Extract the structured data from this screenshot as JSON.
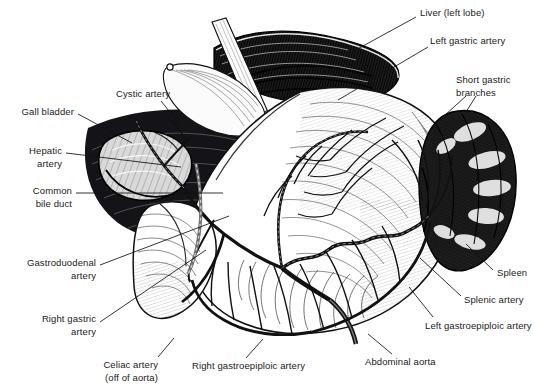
{
  "illustration": {
    "title": "Celiac artery axis and upper abdominal vascular anatomy",
    "style": "pen-and-ink medical engraving, black on white",
    "background_color": "#ffffff",
    "ink_color": "#111111",
    "width": 534,
    "height": 390
  },
  "labels": [
    {
      "id": "liver-left-lobe",
      "text": "Liver (left lobe)",
      "x": 420,
      "y": 12,
      "align": "left",
      "lines": [
        "Liver (left lobe)"
      ]
    },
    {
      "id": "left-gastric-artery",
      "text": "Left gastric artery",
      "x": 430,
      "y": 40,
      "align": "left",
      "lines": [
        "Left gastric artery"
      ]
    },
    {
      "id": "short-gastric-branches",
      "text": "Short gastric branches",
      "x": 456,
      "y": 79,
      "align": "left",
      "lines": [
        "Short gastric",
        "branches"
      ]
    },
    {
      "id": "spleen",
      "text": "Spleen",
      "x": 497,
      "y": 272,
      "align": "left",
      "lines": [
        "Spleen"
      ]
    },
    {
      "id": "splenic-artery",
      "text": "Splenic artery",
      "x": 464,
      "y": 299,
      "align": "left",
      "lines": [
        "Splenic artery"
      ]
    },
    {
      "id": "left-gastroepiploic-artery",
      "text": "Left gastroepiploic artery",
      "x": 425,
      "y": 325,
      "align": "left",
      "lines": [
        "Left gastroepiploic artery"
      ]
    },
    {
      "id": "abdominal-aorta",
      "text": "Abdominal aorta",
      "x": 365,
      "y": 361,
      "align": "left",
      "lines": [
        "Abdominal aorta"
      ]
    },
    {
      "id": "right-gastroepiploic-artery",
      "text": "Right gastroepiploic artery",
      "x": 192,
      "y": 365,
      "align": "left",
      "lines": [
        "Right gastroepiploic artery"
      ]
    },
    {
      "id": "celiac-artery",
      "text": "Celiac artery (off of aorta)",
      "x": 150,
      "y": 364,
      "align": "right",
      "lines": [
        "Celiac artery",
        "(off of aorta)"
      ]
    },
    {
      "id": "right-gastric-artery",
      "text": "Right gastric artery",
      "x": 92,
      "y": 318,
      "align": "right",
      "lines": [
        "Right gastric",
        "artery"
      ]
    },
    {
      "id": "gastroduodenal-artery",
      "text": "Gastroduodenal artery",
      "x": 92,
      "y": 262,
      "align": "right",
      "lines": [
        "Gastroduodenal",
        "artery"
      ]
    },
    {
      "id": "common-bile-duct",
      "text": "Common bile duct",
      "x": 68,
      "y": 190,
      "align": "right",
      "lines": [
        "Common",
        "bile duct"
      ]
    },
    {
      "id": "hepatic-artery",
      "text": "Hepatic artery",
      "x": 58,
      "y": 150,
      "align": "right",
      "lines": [
        "Hepatic",
        "artery"
      ]
    },
    {
      "id": "gall-bladder",
      "text": "Gall bladder",
      "x": 70,
      "y": 111,
      "align": "right",
      "lines": [
        "Gall bladder"
      ]
    },
    {
      "id": "cystic-artery",
      "text": "Cystic artery",
      "x": 116,
      "y": 93,
      "align": "left",
      "lines": [
        "Cystic artery"
      ]
    }
  ],
  "leader_lines": [
    {
      "for": "liver-left-lobe",
      "x1": 416,
      "y1": 17,
      "x2": 352,
      "y2": 52
    },
    {
      "for": "left-gastric-artery",
      "x1": 428,
      "y1": 47,
      "x2": 338,
      "y2": 100
    },
    {
      "for": "short-gastric-branches",
      "x1": 466,
      "y1": 94,
      "x2": 442,
      "y2": 115
    },
    {
      "for": "short-gastric-branches-2",
      "x1": 474,
      "y1": 94,
      "x2": 462,
      "y2": 112
    },
    {
      "for": "spleen",
      "x1": 493,
      "y1": 272,
      "x2": 466,
      "y2": 245
    },
    {
      "for": "splenic-artery",
      "x1": 460,
      "y1": 296,
      "x2": 418,
      "y2": 258
    },
    {
      "for": "left-gastroepiploic-artery",
      "x1": 432,
      "y1": 316,
      "x2": 408,
      "y2": 286
    },
    {
      "for": "abdominal-aorta",
      "x1": 393,
      "y1": 354,
      "x2": 368,
      "y2": 336
    },
    {
      "for": "right-gastroepiploic-artery",
      "x1": 245,
      "y1": 358,
      "x2": 262,
      "y2": 340
    },
    {
      "for": "celiac-artery",
      "x1": 156,
      "y1": 358,
      "x2": 172,
      "y2": 340
    },
    {
      "for": "right-gastric-artery",
      "x1": 97,
      "y1": 322,
      "x2": 205,
      "y2": 250
    },
    {
      "for": "gastroduodenal-artery",
      "x1": 97,
      "y1": 265,
      "x2": 228,
      "y2": 216
    },
    {
      "for": "common-bile-duct",
      "x1": 74,
      "y1": 193,
      "x2": 222,
      "y2": 193
    },
    {
      "for": "hepatic-artery",
      "x1": 64,
      "y1": 153,
      "x2": 180,
      "y2": 167
    },
    {
      "for": "gall-bladder",
      "x1": 76,
      "y1": 114,
      "x2": 131,
      "y2": 142
    },
    {
      "for": "cystic-artery",
      "x1": 162,
      "y1": 101,
      "x2": 184,
      "y2": 130
    }
  ],
  "structures": [
    {
      "id": "liver",
      "name": "Liver (left lobe)",
      "tone": "dark"
    },
    {
      "id": "stomach",
      "name": "Stomach",
      "tone": "light"
    },
    {
      "id": "spleen",
      "name": "Spleen",
      "tone": "dark"
    },
    {
      "id": "duodenum",
      "name": "Duodenum",
      "tone": "light"
    },
    {
      "id": "gallbladder",
      "name": "Gall bladder",
      "tone": "mid"
    },
    {
      "id": "retractor",
      "name": "Surgical retractor",
      "tone": "light"
    }
  ]
}
